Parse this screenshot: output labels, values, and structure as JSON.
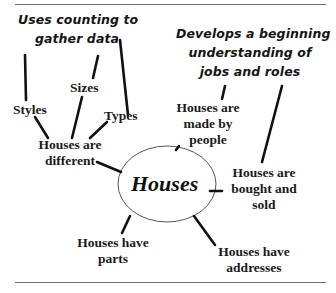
{
  "diagram": {
    "type": "concept-web",
    "center": {
      "label": "Houses"
    },
    "annotations": {
      "counting": {
        "line1": "Uses counting to",
        "line2": "gather data"
      },
      "jobs": {
        "line1": "Develops a beginning",
        "line2": "understanding of",
        "line3": "jobs and roles"
      }
    },
    "nodes": {
      "styles": "Styles",
      "sizes": "Sizes",
      "types": "Types",
      "different": {
        "line1": "Houses are",
        "line2": "different"
      },
      "made_by_people": {
        "line1": "Houses are",
        "line2": "made by",
        "line3": "people"
      },
      "bought_sold": {
        "line1": "Houses are",
        "line2": "bought and",
        "line3": "sold"
      },
      "parts": {
        "line1": "Houses have",
        "line2": "parts"
      },
      "addresses": {
        "line1": "Houses have",
        "line2": "addresses"
      }
    },
    "colors": {
      "ink": "#111111",
      "rule": "#6e6e6e",
      "ellipse_stroke": "#555555",
      "background": "#ffffff"
    }
  }
}
